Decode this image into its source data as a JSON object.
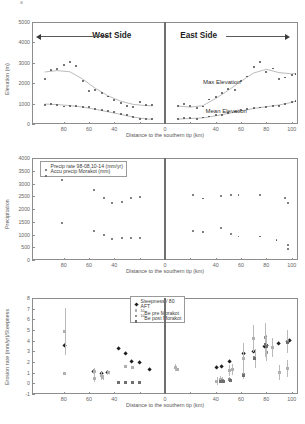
{
  "figure": {
    "title": "",
    "top_mark": "a",
    "x_axis_label": "Distance to the southern tip (km)"
  },
  "chart_data": [
    {
      "type": "scatter",
      "panel": 1,
      "title": "",
      "xlabel": "Distance to the southern tip (km)",
      "ylabel": "Elevation (m)",
      "xlim": [
        -105,
        105
      ],
      "ylim": [
        0,
        5000
      ],
      "xticks": [
        -80,
        -60,
        -40,
        -20,
        0,
        20,
        40,
        60,
        80,
        100
      ],
      "xticklabels": [
        "80",
        "60",
        "40",
        "",
        "0",
        "",
        "40",
        "60",
        "80",
        "100"
      ],
      "yticks": [
        0,
        1000,
        2000,
        3000,
        4000,
        5000
      ],
      "yticklabels": [
        "0",
        "1000",
        "2000",
        "3000",
        "4000",
        "5000"
      ],
      "grid": false,
      "legend_position": "none",
      "annotations": [
        {
          "text": "West Side",
          "x": -38,
          "y": 4320
        },
        {
          "text": "East Side",
          "x": 22,
          "y": 4320
        },
        {
          "text": "Max Elevation",
          "x": 40,
          "y": 2050
        },
        {
          "text": "Mean Elevation",
          "x": 42,
          "y": 560
        },
        {
          "text": "arrow-left-west",
          "x": -95,
          "y": 4320
        },
        {
          "text": "arrow-right-east",
          "x": 95,
          "y": 4320
        }
      ],
      "series": [
        {
          "name": "Max Elevation",
          "marker": "dot",
          "color": "#4a4a4a",
          "x": [
            -95,
            -90,
            -85,
            -80,
            -75,
            -70,
            -65,
            -60,
            -55,
            -50,
            -45,
            -40,
            -35,
            -30,
            -25,
            -20,
            -15,
            -10,
            10,
            15,
            20,
            25,
            30,
            35,
            40,
            45,
            50,
            55,
            60,
            65,
            70,
            75,
            80,
            85,
            90,
            95,
            100,
            103
          ],
          "y": [
            2200,
            2650,
            2680,
            2900,
            3050,
            2830,
            2120,
            1600,
            1650,
            1500,
            1350,
            1180,
            1030,
            900,
            820,
            1080,
            930,
            930,
            900,
            1000,
            870,
            790,
            860,
            1200,
            1320,
            1510,
            1700,
            1650,
            2100,
            2330,
            2800,
            3060,
            2560,
            2720,
            2200,
            2280,
            2380,
            2460
          ]
        },
        {
          "name": "Mean Elevation",
          "marker": "dot",
          "color": "#4a4a4a",
          "x": [
            -95,
            -90,
            -85,
            -80,
            -75,
            -70,
            -65,
            -60,
            -55,
            -50,
            -45,
            -40,
            -35,
            -30,
            -25,
            -20,
            -15,
            -10,
            10,
            15,
            20,
            25,
            30,
            35,
            40,
            45,
            50,
            55,
            60,
            65,
            70,
            75,
            80,
            85,
            90,
            95,
            100,
            103
          ],
          "y": [
            910,
            970,
            940,
            860,
            900,
            880,
            840,
            820,
            740,
            700,
            620,
            580,
            500,
            430,
            350,
            260,
            230,
            230,
            230,
            280,
            290,
            240,
            320,
            370,
            420,
            460,
            540,
            610,
            680,
            720,
            790,
            810,
            850,
            890,
            880,
            1000,
            1100,
            1130
          ]
        }
      ],
      "fit_curves": [
        {
          "name": "max-elevation-fit",
          "color": "#a9a9a9",
          "x": [
            -95,
            -85,
            -75,
            -65,
            -55,
            -45,
            -35,
            -25,
            -15,
            -10
          ],
          "y": [
            2550,
            2620,
            2560,
            2200,
            1750,
            1380,
            1120,
            960,
            900,
            890
          ]
        },
        {
          "name": "mean-elevation-fit",
          "color": "#a9a9a9",
          "x": [
            -95,
            -85,
            -75,
            -65,
            -55,
            -45,
            -35,
            -25,
            -15,
            -10
          ],
          "y": [
            980,
            950,
            900,
            830,
            720,
            600,
            470,
            340,
            250,
            230
          ]
        },
        {
          "name": "max-elevation-fit-east",
          "color": "#a9a9a9",
          "x": [
            10,
            20,
            30,
            40,
            50,
            60,
            70,
            80,
            90,
            100,
            103
          ],
          "y": [
            880,
            830,
            900,
            1250,
            1650,
            2100,
            2500,
            2680,
            2520,
            2460,
            2470
          ]
        },
        {
          "name": "mean-elevation-fit-east",
          "color": "#a9a9a9",
          "x": [
            10,
            20,
            30,
            40,
            50,
            60,
            70,
            80,
            90,
            100,
            103
          ],
          "y": [
            240,
            270,
            300,
            400,
            520,
            640,
            760,
            850,
            930,
            1060,
            1120
          ]
        }
      ]
    },
    {
      "type": "scatter",
      "panel": 2,
      "title": "",
      "xlabel": "Distance to the southern tip (km)",
      "ylabel": "Precipitation",
      "xlim": [
        -105,
        105
      ],
      "ylim": [
        0,
        4000
      ],
      "xticks": [
        -80,
        -60,
        -40,
        -20,
        0,
        20,
        40,
        60,
        80,
        100
      ],
      "xticklabels": [
        "80",
        "60",
        "40",
        "",
        "0",
        "",
        "40",
        "60",
        "80",
        "100"
      ],
      "yticks": [
        0,
        500,
        1000,
        1500,
        2000,
        2500,
        3000,
        3500,
        4000
      ],
      "yticklabels": [
        "0",
        "500",
        "1000",
        "1500",
        "2000",
        "2500",
        "3000",
        "3500",
        "4000"
      ],
      "grid": false,
      "legend_position": "upper-left",
      "legend": [
        {
          "label": "Precip rate 98-08,10-14 (mm/yr)",
          "marker": "dot",
          "color": "#5a5a5a"
        },
        {
          "label": "Accu precip Morakot (mm)",
          "marker": "dot",
          "color": "#5a5a5a"
        }
      ],
      "series": [
        {
          "name": "Accu precip Morakot (mm)",
          "marker": "dot",
          "color": "#5a5a5a",
          "x": [
            -81,
            -56,
            -48,
            -42,
            -34,
            -27,
            -20,
            22,
            30,
            44,
            52,
            58,
            75,
            95,
            97
          ],
          "y": [
            3120,
            2760,
            2420,
            2220,
            2270,
            2440,
            2460,
            2560,
            2410,
            2510,
            2540,
            2540,
            2540,
            2420,
            2250
          ]
        },
        {
          "name": "Precip rate 98-08,10-14 (mm/yr)",
          "marker": "dot",
          "color": "#5a5a5a",
          "x": [
            -81,
            -56,
            -48,
            -42,
            -34,
            -27,
            -20,
            22,
            30,
            44,
            52,
            58,
            75,
            88,
            97,
            97
          ],
          "y": [
            1440,
            1140,
            980,
            840,
            870,
            870,
            870,
            1140,
            1100,
            1250,
            1010,
            920,
            920,
            790,
            600,
            440
          ]
        }
      ]
    },
    {
      "type": "scatter",
      "panel": 3,
      "title": "",
      "xlabel": "Distance to the southern tip (km)",
      "ylabel": "Erosion rate (mm/yr)/Steepness",
      "xlim": [
        -105,
        105
      ],
      "ylim": [
        -1,
        8
      ],
      "xticks": [
        -80,
        -60,
        -40,
        -20,
        0,
        20,
        40,
        60,
        80,
        100
      ],
      "xticklabels": [
        "80",
        "60",
        "40",
        "",
        "0",
        "",
        "40",
        "60",
        "80",
        "100"
      ],
      "yticks": [
        -1,
        0,
        1,
        2,
        3,
        4,
        5,
        6,
        7,
        8
      ],
      "yticklabels": [
        "-1",
        "0",
        "1",
        "2",
        "3",
        "4",
        "5",
        "6",
        "7",
        "8"
      ],
      "grid": false,
      "legend_position": "upper-center",
      "legend": [
        {
          "label": "Steepness / 80",
          "marker": "diamond",
          "color": "#1f1f1f"
        },
        {
          "label": "AFT",
          "marker": "square",
          "color": "#b0b0b0"
        },
        {
          "label": "10Be pre Morakot",
          "marker": "square",
          "color": "#909090"
        },
        {
          "label": "10Be post Morakot",
          "marker": "square",
          "color": "#707070"
        }
      ],
      "series": [
        {
          "name": "Steepness / 80",
          "marker": "diamond",
          "color": "#1f1f1f",
          "x": [
            -79,
            -56,
            -50,
            -45,
            -37,
            -31,
            -26,
            -20,
            -12,
            41,
            45,
            51,
            62,
            70,
            79,
            80,
            90,
            97,
            98
          ],
          "y": [
            3.5,
            1.1,
            0.9,
            1.0,
            3.25,
            2.8,
            2.0,
            1.9,
            1.25,
            1.5,
            1.6,
            2.0,
            2.75,
            3.0,
            3.4,
            3.55,
            3.75,
            3.9,
            4.0
          ],
          "yerr": [
            0.0,
            0.0,
            0.0,
            0.0,
            0.0,
            0.0,
            0.0,
            0.0,
            0.0,
            0.0,
            0.0,
            0.0,
            0.0,
            0.0,
            0.0,
            0.0,
            0.0,
            0.0,
            0.0
          ]
        },
        {
          "name": "AFT",
          "marker": "square",
          "color": "#b0b0b0",
          "x": [
            -79,
            -79,
            -56,
            -56,
            -50,
            -49,
            -45,
            -31,
            -26,
            8,
            10,
            41,
            44,
            45,
            51,
            53,
            62,
            70,
            71,
            79,
            80,
            85,
            90,
            97
          ],
          "y": [
            4.9,
            0.95,
            1.1,
            0.45,
            0.7,
            0.55,
            1.0,
            1.55,
            1.45,
            1.5,
            1.3,
            0.2,
            0.35,
            0.3,
            1.2,
            1.3,
            2.3,
            4.2,
            2.35,
            4.3,
            3.5,
            3.35,
            1.0,
            1.35
          ],
          "yerr": [
            2.2,
            0.0,
            0.35,
            0.3,
            0.35,
            0.25,
            0.0,
            0.0,
            0.0,
            0.35,
            0.0,
            0.35,
            0.3,
            0.25,
            0.5,
            0.5,
            1.5,
            1.3,
            0.9,
            1.4,
            1.0,
            0.9,
            0.7,
            0.8
          ]
        },
        {
          "name": "10Be pre Morakot",
          "marker": "square",
          "color": "#909090",
          "x": [
            -37,
            -31,
            -26,
            -20,
            44,
            45,
            51,
            62,
            71,
            79,
            80,
            97
          ],
          "y": [
            0.05,
            0.05,
            0.05,
            0.05,
            0.2,
            0.25,
            0.35,
            0.8,
            2.4,
            4.3,
            2.85,
            3.9
          ],
          "yerr": [
            0.0,
            0.0,
            0.0,
            0.0,
            0.1,
            0.1,
            0.2,
            0.4,
            0.8,
            1.3,
            0.8,
            1.1
          ]
        },
        {
          "name": "10Be post Morakot",
          "marker": "square",
          "color": "#6f6f6f",
          "x": [
            -37,
            -31,
            -26,
            -20,
            44,
            46,
            52,
            62,
            71,
            79,
            80,
            97
          ],
          "y": [
            0.05,
            0.05,
            0.05,
            0.05,
            0.15,
            0.2,
            0.3,
            0.75,
            2.3,
            3.6,
            3.45,
            3.8
          ],
          "yerr": [
            0.0,
            0.0,
            0.0,
            0.0,
            0.1,
            0.1,
            0.15,
            0.35,
            0.7,
            1.1,
            0.9,
            1.0
          ]
        }
      ]
    }
  ]
}
